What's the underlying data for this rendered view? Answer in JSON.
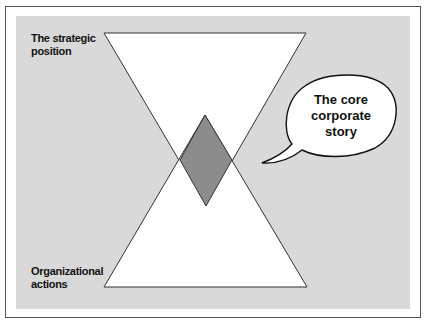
{
  "diagram": {
    "labels": {
      "top_left": [
        "The strategic",
        "position"
      ],
      "bottom_left": [
        "Organizational",
        "actions"
      ]
    },
    "bubble": {
      "lines": [
        "The core",
        "corporate",
        "story"
      ]
    },
    "colors": {
      "background_panel": "#d9d9d9",
      "triangle_fill": "#ffffff",
      "diamond_fill": "#8c8c8c",
      "stroke": "#333333"
    }
  }
}
